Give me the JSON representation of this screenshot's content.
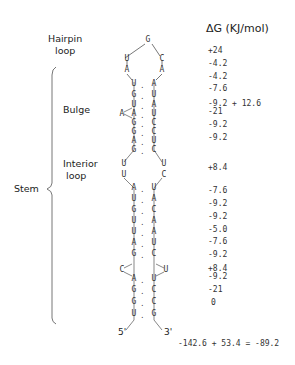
{
  "header": {
    "dg_title": "ΔG (KJ/mol)"
  },
  "labels": {
    "hairpin": "Hairpin",
    "hairpin2": "loop",
    "bulge": "Bulge",
    "interior": "Interior",
    "interior2": "loop",
    "stem": "Stem"
  },
  "ends": {
    "five": "5'",
    "three": "3'"
  },
  "hairpin": {
    "top": "G",
    "left": [
      "U",
      "A"
    ],
    "right": [
      "C",
      "A"
    ]
  },
  "pairs": [
    {
      "l": "U",
      "r": "A"
    },
    {
      "l": "G",
      "r": "U"
    },
    {
      "l": "U",
      "r": "A"
    },
    {
      "l": "A",
      "r": "U"
    },
    {
      "l": "G",
      "r": "C"
    },
    {
      "l": "G",
      "r": "C"
    },
    {
      "l": "A",
      "r": "U"
    },
    {
      "l": "G",
      "r": "C"
    },
    {
      "l": "A",
      "r": "U"
    },
    {
      "l": "U",
      "r": "A"
    },
    {
      "l": "G",
      "r": "C"
    },
    {
      "l": "U",
      "r": "A"
    },
    {
      "l": "U",
      "r": "A"
    },
    {
      "l": "A",
      "r": "U"
    },
    {
      "l": "G",
      "r": "C"
    },
    {
      "l": "A",
      "r": "U"
    },
    {
      "l": "G",
      "r": "C"
    },
    {
      "l": "G",
      "r": "C"
    },
    {
      "l": "U",
      "r": "G"
    }
  ],
  "bulge_nt": "A",
  "interior_left": [
    "U",
    "U"
  ],
  "interior_right": [
    "U",
    "C"
  ],
  "lower_bulge_left": "C",
  "lower_bulge_right": "U",
  "dg_values": [
    "+24",
    "-4.2",
    "-4.2",
    "-7.6",
    "-9.2 + 12.6",
    "-21",
    "-9.2",
    "-9.2",
    "+8.4",
    "-7.6",
    "-9.2",
    "-9.2",
    "-5.0",
    "-7.6",
    "-9.2",
    "+8.4",
    "-9.2",
    "-21",
    "0"
  ],
  "total": "-142.6 + 53.4 = -89.2"
}
